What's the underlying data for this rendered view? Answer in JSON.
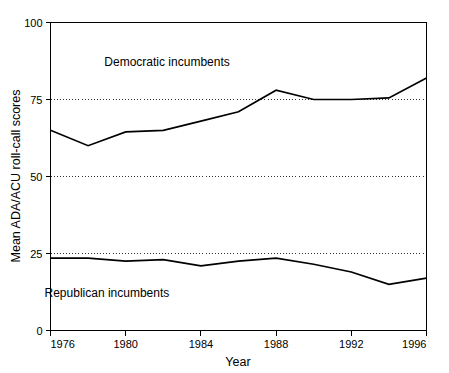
{
  "chart_data": {
    "type": "line",
    "title": "",
    "xlabel": "Year",
    "ylabel": "Mean ADA/ACU roll-call scores",
    "xlim": [
      1976,
      1996
    ],
    "ylim": [
      0,
      100
    ],
    "grid": "horizontal dotted at 25, 50, 75",
    "legend_position": "inline annotations next to each series",
    "x_ticks": [
      "1976",
      "1980",
      "1984",
      "1988",
      "1992",
      "1996"
    ],
    "x_tick_values": [
      1976,
      1980,
      1984,
      1988,
      1992,
      1996
    ],
    "y_ticks": [
      "0",
      "25",
      "50",
      "75",
      "100"
    ],
    "y_tick_values": [
      0,
      25,
      50,
      75,
      100
    ],
    "x": [
      1976,
      1978,
      1980,
      1982,
      1984,
      1986,
      1988,
      1990,
      1992,
      1994,
      1996
    ],
    "series": [
      {
        "name": "Democratic incumbents",
        "values": [
          65,
          60,
          64.5,
          65,
          68,
          71,
          78,
          75,
          75,
          75.5,
          82
        ]
      },
      {
        "name": "Republican incumbents",
        "values": [
          23.5,
          23.5,
          22.5,
          23,
          21,
          22.5,
          23.5,
          21.5,
          19,
          15,
          17
        ]
      }
    ],
    "annotations": [
      {
        "text": "Democratic incumbents",
        "x": 1982.2,
        "y": 86
      },
      {
        "text": "Republican incumbents",
        "x": 1979.0,
        "y": 11
      }
    ]
  },
  "colors": {
    "line": "#000000",
    "axis": "#000000",
    "grid": "#000000",
    "background": "#ffffff"
  }
}
